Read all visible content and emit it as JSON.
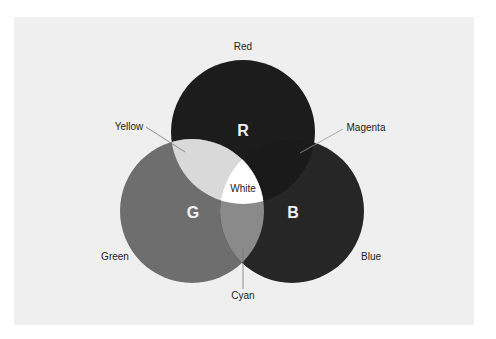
{
  "diagram": {
    "circles": [
      {
        "id": "red",
        "letter": "R",
        "label": "Red",
        "color": "#1c1c1c"
      },
      {
        "id": "green",
        "letter": "G",
        "label": "Green",
        "color": "#6e6e6e"
      },
      {
        "id": "blue",
        "letter": "B",
        "label": "Blue",
        "color": "#262626"
      }
    ],
    "overlaps": {
      "yellow": {
        "label": "Yellow",
        "color": "#d9d9d9"
      },
      "magenta": {
        "label": "Magenta",
        "color": "#1a1a1a"
      },
      "cyan": {
        "label": "Cyan",
        "color": "#8a8a8a"
      },
      "white": {
        "label": "White",
        "color": "#ffffff"
      }
    },
    "background_color": "#efefef"
  }
}
